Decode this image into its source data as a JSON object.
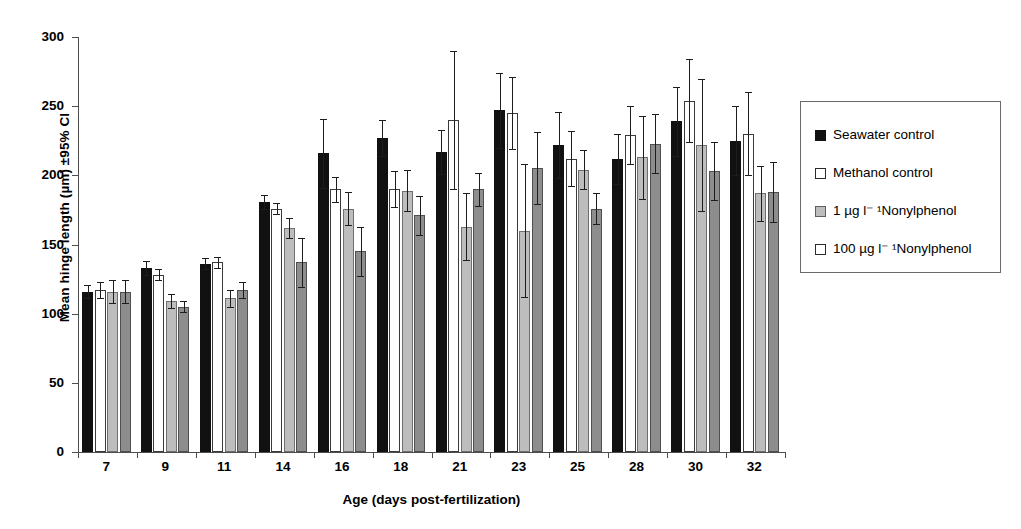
{
  "chart_data": {
    "type": "bar",
    "title": "",
    "xlabel": "Age (days post-fertilization)",
    "ylabel": "Mean hinge length (µm) ±95% CI",
    "ylim": [
      0,
      300
    ],
    "yticks": [
      0,
      50,
      100,
      150,
      200,
      250,
      300
    ],
    "grid": false,
    "legend_position": "right-outside",
    "categories": [
      "7",
      "9",
      "11",
      "14",
      "16",
      "18",
      "21",
      "23",
      "25",
      "28",
      "30",
      "32"
    ],
    "series": [
      {
        "name": "Seawater control",
        "color": "#111111",
        "values": [
          116,
          133,
          136,
          181,
          216,
          227,
          217,
          247,
          222,
          212,
          239,
          225
        ],
        "errors": [
          5,
          5,
          4,
          5,
          25,
          13,
          16,
          27,
          24,
          18,
          25,
          25
        ]
      },
      {
        "name": "Methanol control",
        "color": "#ffffff",
        "values": [
          117,
          128,
          137,
          176,
          190,
          190,
          240,
          245,
          212,
          229,
          254,
          230
        ],
        "errors": [
          6,
          4,
          4,
          4,
          9,
          13,
          50,
          26,
          20,
          21,
          30,
          30
        ]
      },
      {
        "name": "1 µg l⁻¹ Nonylphenol",
        "color": "#bdbdbd",
        "values": [
          116,
          109,
          111,
          162,
          176,
          189,
          163,
          160,
          204,
          213,
          222,
          187
        ],
        "errors": [
          8,
          5,
          6,
          7,
          12,
          15,
          24,
          48,
          14,
          30,
          48,
          20
        ]
      },
      {
        "name": "100 µg l⁻¹ Nonylphenol",
        "color": "#8d8d8d",
        "values": [
          116,
          105,
          117,
          137,
          145,
          171,
          190,
          205,
          176,
          223,
          203,
          188
        ]
      }
    ],
    "series_last_errors": [
      8,
      4,
      6,
      18,
      18,
      14,
      12,
      26,
      11,
      21,
      21,
      22
    ]
  },
  "axis": {
    "y_tick_labels": [
      "300",
      "250",
      "200",
      "150",
      "100",
      "50",
      "0"
    ],
    "y_title": "Mean hinge length (µm) ±95% CI",
    "x_title": "Age (days post-fertilization)",
    "x_tick_labels": [
      "7",
      "9",
      "11",
      "14",
      "16",
      "18",
      "21",
      "23",
      "25",
      "28",
      "30",
      "32"
    ]
  },
  "legend": {
    "items": [
      {
        "label": "Seawater control",
        "swatch": "filled-black-square"
      },
      {
        "label": "Methanol control",
        "swatch": "open-white-square"
      },
      {
        "label": "1 µg l⁻ ¹Nonylphenol",
        "swatch": "filled-gray-square"
      },
      {
        "label": "100 µg l⁻ ¹Nonylphenol",
        "swatch": "open-white-square"
      }
    ]
  },
  "colors": {
    "seawater": "#111111",
    "methanol": "#ffffff",
    "np_low": "#bdbdbd",
    "np_high": "#8d8d8d",
    "axis": "#4d4d4d"
  }
}
